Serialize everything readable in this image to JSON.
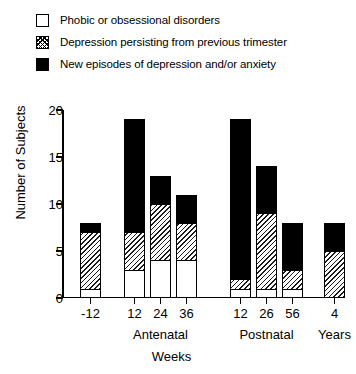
{
  "legend": {
    "items": [
      {
        "swatch": "empty-box",
        "label": "Phobic or obsessional disorders"
      },
      {
        "swatch": "hatched-box",
        "label": "Depression persisting from previous trimester"
      },
      {
        "swatch": "solid-black-box",
        "label": "New episodes of depression and/or anxiety"
      }
    ]
  },
  "chart_data": {
    "type": "bar",
    "subtype": "stacked",
    "title": "",
    "xlabel": "Weeks",
    "ylabel": "Number of Subjects",
    "ylim": [
      0,
      20
    ],
    "yticks": [
      0,
      5,
      10,
      15,
      20
    ],
    "grid": false,
    "legend_position": "top-left",
    "categories": [
      "-12",
      "12",
      "24",
      "36",
      "12",
      "26",
      "56",
      "4"
    ],
    "group_labels": [
      "Antenatal",
      "Postnatal",
      "Years"
    ],
    "groups": [
      {
        "name": "",
        "categories": [
          "-12"
        ]
      },
      {
        "name": "Antenatal",
        "categories": [
          "12",
          "24",
          "36"
        ]
      },
      {
        "name": "Postnatal",
        "categories": [
          "12",
          "26",
          "56"
        ]
      },
      {
        "name": "Years",
        "categories": [
          "4"
        ]
      }
    ],
    "series": [
      {
        "name": "Phobic or obsessional disorders",
        "fill": "white",
        "values": [
          1,
          3,
          4,
          4,
          1,
          1,
          1,
          0
        ]
      },
      {
        "name": "Depression persisting from previous trimester",
        "fill": "hatched",
        "values": [
          6,
          4,
          6,
          4,
          1,
          8,
          2,
          5
        ]
      },
      {
        "name": "New episodes of depression and/or anxiety",
        "fill": "black",
        "values": [
          1,
          12,
          3,
          3,
          17,
          5,
          5,
          3
        ]
      }
    ],
    "totals": [
      8,
      19,
      13,
      11,
      19,
      14,
      8,
      8
    ]
  },
  "colors": {
    "axis": "#000000",
    "black_fill": "#000000",
    "white_fill": "#ffffff",
    "hatch_stroke": "#1a1a1a"
  }
}
